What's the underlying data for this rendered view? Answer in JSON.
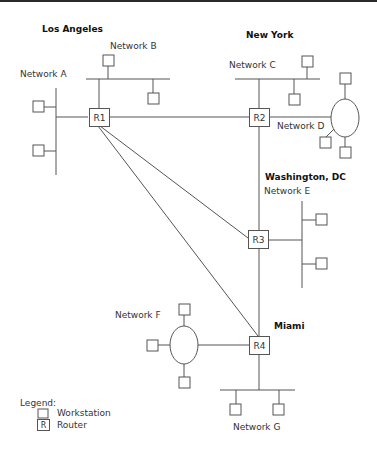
{
  "cities": {
    "la": "Los Angeles",
    "ny": "New York",
    "dc": "Washington, DC",
    "miami": "Miami"
  },
  "networks": {
    "a": "Network A",
    "b": "Network B",
    "c": "Network C",
    "d": "Network D",
    "e": "Network E",
    "f": "Network F",
    "g": "Network G"
  },
  "routers": {
    "r1": "R1",
    "r2": "R2",
    "r3": "R3",
    "r4": "R4"
  },
  "legend": {
    "title": "Legend:",
    "workstation": "Workstation",
    "router_symbol": "R",
    "router": "Router"
  },
  "colors": {
    "line": "#555555",
    "text": "#333333",
    "background": "#ffffff"
  }
}
